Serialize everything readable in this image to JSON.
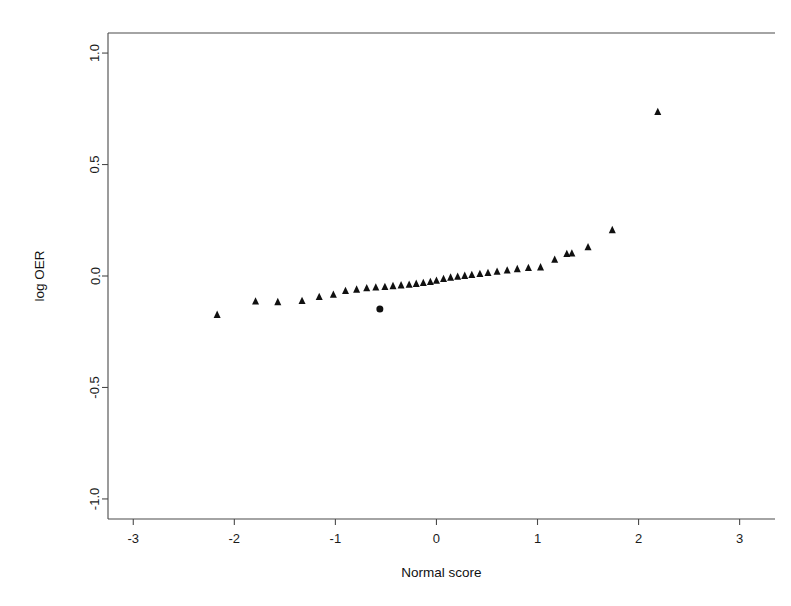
{
  "chart_data": {
    "type": "scatter",
    "title": "",
    "xlabel": "Normal score",
    "ylabel": "log OER",
    "xlim": [
      -3.25,
      3.35
    ],
    "ylim": [
      -1.09,
      1.09
    ],
    "xticks": [
      -3,
      -2,
      -1,
      0,
      1,
      2,
      3
    ],
    "xticklabels": [
      "-3",
      "-2",
      "-1",
      "0",
      "1",
      "2",
      "3"
    ],
    "yticks": [
      -1.0,
      -0.5,
      0.0,
      0.5,
      1.0
    ],
    "yticklabels": [
      "-1.0",
      "-0.5",
      "0.0",
      "0.5",
      "1.0"
    ],
    "grid": false,
    "legend": null,
    "frame": "box",
    "series": [
      {
        "name": "log OER quantiles",
        "marker": "triangle",
        "color": "#101010",
        "points": [
          [
            -2.17,
            -0.175
          ],
          [
            -1.79,
            -0.115
          ],
          [
            -1.57,
            -0.118
          ],
          [
            -1.33,
            -0.113
          ],
          [
            -1.16,
            -0.095
          ],
          [
            -1.02,
            -0.085
          ],
          [
            -0.9,
            -0.068
          ],
          [
            -0.79,
            -0.062
          ],
          [
            -0.69,
            -0.056
          ],
          [
            -0.6,
            -0.052
          ],
          [
            -0.51,
            -0.05
          ],
          [
            -0.43,
            -0.046
          ],
          [
            -0.35,
            -0.043
          ],
          [
            -0.27,
            -0.04
          ],
          [
            -0.2,
            -0.036
          ],
          [
            -0.13,
            -0.032
          ],
          [
            -0.06,
            -0.028
          ],
          [
            0.0,
            -0.022
          ],
          [
            0.07,
            -0.014
          ],
          [
            0.14,
            -0.008
          ],
          [
            0.21,
            -0.004
          ],
          [
            0.28,
            0.0
          ],
          [
            0.35,
            0.004
          ],
          [
            0.43,
            0.008
          ],
          [
            0.51,
            0.013
          ],
          [
            0.6,
            0.018
          ],
          [
            0.7,
            0.024
          ],
          [
            0.8,
            0.03
          ],
          [
            0.91,
            0.035
          ],
          [
            1.03,
            0.038
          ],
          [
            1.17,
            0.072
          ],
          [
            1.29,
            0.098
          ],
          [
            1.34,
            0.1
          ],
          [
            1.5,
            0.128
          ],
          [
            1.74,
            0.205
          ],
          [
            2.19,
            0.735
          ]
        ]
      },
      {
        "name": "outlying observation",
        "marker": "circle",
        "color": "#101010",
        "points": [
          [
            -0.56,
            -0.148
          ]
        ]
      }
    ]
  },
  "axes": {
    "x_title": "Normal score",
    "y_title": "log OER"
  }
}
